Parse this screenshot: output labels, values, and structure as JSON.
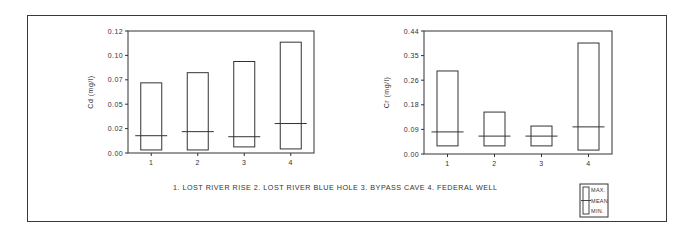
{
  "caption": "1. LOST RIVER RISE   2. LOST RIVER BLUE HOLE   3. BYPASS CAVE   4. FEDERAL WELL",
  "legend": {
    "max": "MAX.",
    "mean": "MEAN",
    "min": "MIN."
  },
  "chart_data": [
    {
      "type": "box (min/mean/max range bars)",
      "title": "",
      "xlabel": "",
      "ylabel": "Cd (mg/l)",
      "categories": [
        "1",
        "2",
        "3",
        "4"
      ],
      "category_names": [
        "LOST RIVER RISE",
        "LOST RIVER BLUE HOLE",
        "BYPASS CAVE",
        "FEDERAL WELL"
      ],
      "yticks": [
        "0.00",
        "0.02",
        "0.05",
        "0.07",
        "0.10",
        "0.12"
      ],
      "ylim": [
        0,
        0.12
      ],
      "grid": false,
      "series": [
        {
          "name": "MAX.",
          "values": [
            0.069,
            0.079,
            0.09,
            0.109
          ]
        },
        {
          "name": "MEAN",
          "values": [
            0.017,
            0.021,
            0.016,
            0.029
          ]
        },
        {
          "name": "MIN.",
          "values": [
            0.003,
            0.003,
            0.006,
            0.004
          ]
        }
      ]
    },
    {
      "type": "box (min/mean/max range bars)",
      "title": "",
      "xlabel": "",
      "ylabel": "Cr (mg/l)",
      "categories": [
        "1",
        "2",
        "3",
        "4"
      ],
      "category_names": [
        "LOST RIVER RISE",
        "LOST RIVER BLUE HOLE",
        "BYPASS CAVE",
        "FEDERAL WELL"
      ],
      "yticks": [
        "0.00",
        "0.09",
        "0.18",
        "0.26",
        "0.35",
        "0.44"
      ],
      "ylim": [
        0,
        0.44
      ],
      "grid": false,
      "series": [
        {
          "name": "MAX.",
          "values": [
            0.297,
            0.15,
            0.1,
            0.397
          ]
        },
        {
          "name": "MEAN",
          "values": [
            0.079,
            0.064,
            0.064,
            0.097
          ]
        },
        {
          "name": "MIN.",
          "values": [
            0.029,
            0.029,
            0.029,
            0.014
          ]
        }
      ]
    }
  ]
}
